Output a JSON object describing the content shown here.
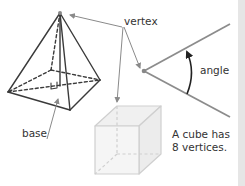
{
  "labels": {
    "vertex": "vertex",
    "angle": "angle",
    "base": "base",
    "cube_note_line1": "A cube has",
    "cube_note_line2": "8 vertices."
  },
  "colors": {
    "shape_stroke": "#3a3a3a",
    "pointer_stroke": "#8a8a8a",
    "angle_ray": "#8c8c8c",
    "cube_stroke": "#cfcfcf",
    "cube_fill": "#f3f3f3",
    "side_strip": "#e6e6e6"
  },
  "figures": [
    {
      "name": "square-based-pyramid",
      "annotation": "base"
    },
    {
      "name": "angle",
      "annotation": "angle"
    },
    {
      "name": "cube",
      "annotation": "A cube has 8 vertices."
    }
  ]
}
